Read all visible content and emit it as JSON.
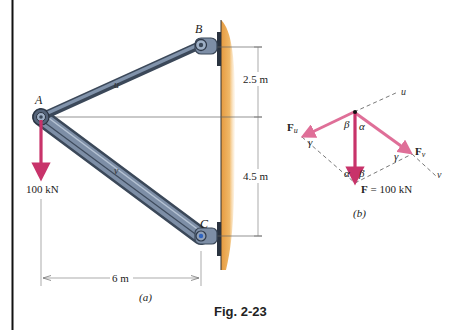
{
  "figure": {
    "caption": "Fig. 2-23",
    "part_a_label": "(a)",
    "part_b_label": "(b)"
  },
  "part_a": {
    "points": {
      "A": "A",
      "B": "B",
      "C": "C"
    },
    "members": {
      "u": "u",
      "v": "v"
    },
    "load_label": "100 kN",
    "dim_horizontal": "6 m",
    "dim_upper": "2.5 m",
    "dim_lower": "4.5 m"
  },
  "part_b": {
    "Fu_label": "F",
    "Fu_sub": "u",
    "Fv_label": "F",
    "Fv_sub": "v",
    "F_label": "F",
    "F_value": " = 100 kN",
    "axis_u": "u",
    "axis_v": "v",
    "angle_alpha": "α",
    "angle_beta": "β",
    "angle_gamma": "γ"
  },
  "colors": {
    "member": "#4b5a70",
    "member_light": "#8a9bb3",
    "wall": "#e8a14a",
    "force": "#c8336a",
    "force_light": "#e07aa0",
    "border": "#111111"
  }
}
